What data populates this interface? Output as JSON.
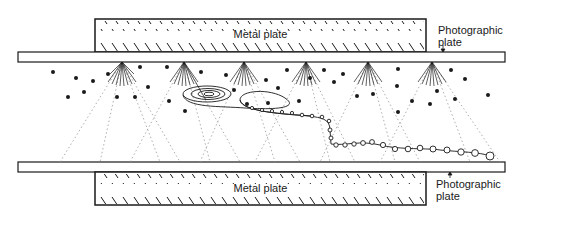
{
  "diagram": {
    "labels": {
      "top_metal_plate": "Metal plate",
      "bottom_metal_plate": "Metal plate",
      "top_photo_plate_line1": "Photographic",
      "top_photo_plate_line2": "plate",
      "bottom_photo_plate_line1": "Photographic",
      "bottom_photo_plate_line2": "plate"
    },
    "colors": {
      "ink": "#1a1a1a",
      "dotted": "#9a9a9a",
      "background": "#ffffff"
    },
    "spray_sources_x": [
      122,
      184,
      244,
      306,
      368,
      432
    ],
    "elements": [
      "metal plate (top)",
      "photographic plate (top)",
      "particle sprays",
      "scattered droplets",
      "spiral track",
      "beaded track",
      "photographic plate (bottom)",
      "metal plate (bottom)"
    ]
  }
}
